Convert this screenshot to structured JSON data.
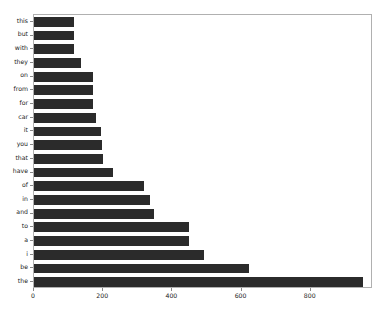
{
  "chart_data": {
    "type": "bar",
    "orientation": "horizontal",
    "title": "",
    "xlabel": "",
    "ylabel": "",
    "grid": false,
    "legend": null,
    "xlim": [
      0,
      980
    ],
    "xticks": [
      0,
      200,
      400,
      600,
      800
    ],
    "bar_color": "#2b2b2b",
    "categories": [
      "this",
      "but",
      "with",
      "they",
      "on",
      "from",
      "for",
      "car",
      "it",
      "you",
      "that",
      "have",
      "of",
      "in",
      "and",
      "to",
      "a",
      "i",
      "be",
      "the"
    ],
    "values": [
      116,
      116,
      116,
      135,
      170,
      170,
      170,
      178,
      193,
      197,
      200,
      228,
      318,
      335,
      347,
      448,
      448,
      491,
      621,
      951
    ]
  },
  "axes": {
    "x_tick_labels": [
      "0",
      "200",
      "400",
      "600",
      "800"
    ],
    "y_tick_labels": [
      "this",
      "but",
      "with",
      "they",
      "on",
      "from",
      "for",
      "car",
      "it",
      "you",
      "that",
      "have",
      "of",
      "in",
      "and",
      "to",
      "a",
      "i",
      "be",
      "the"
    ]
  },
  "colors": {
    "bar": "#2b2b2b",
    "frame": "#b0b0b0",
    "text": "#1a1a1a",
    "background": "#ffffff"
  }
}
